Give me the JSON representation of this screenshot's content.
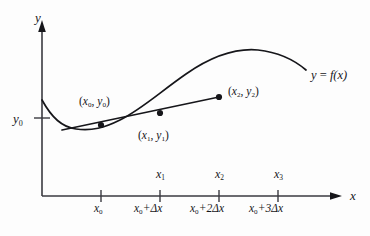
{
  "figure": {
    "type": "calculus-secant-diagram",
    "background_color": "#fdfdfd",
    "ink_color": "#16161a"
  },
  "axes": {
    "y_label": "y",
    "x_label": "x",
    "origin": {
      "x": 42,
      "y": 196
    },
    "y_axis_top": {
      "x": 42,
      "y": 22
    },
    "x_axis_right": {
      "x": 340,
      "y": 196
    }
  },
  "y_axis": {
    "tick_label": "y",
    "tick_sub": "0",
    "tick_y": 118
  },
  "curve": {
    "label_y": "y",
    "label_eq": " = ",
    "label_f": "f",
    "label_arg": "(x)",
    "path": "M 42,100 C 52,118 62,127 76,129 C 92,131 104,128 120,120 C 142,109 160,92 186,74 C 212,56 236,48 258,50 C 276,52 292,58 306,70"
  },
  "secant": {
    "path": "M 62,130 L 219,97",
    "x_start": 62,
    "y_start": 130,
    "x_end": 219,
    "y_end": 97
  },
  "points": [
    {
      "name": "point-x0",
      "cx": 101,
      "cy": 125,
      "label_open": "(",
      "label_x": "x",
      "label_xsub": "0",
      "label_comma": ", ",
      "label_y": "y",
      "label_ysub": "0",
      "label_close": ")"
    },
    {
      "name": "point-x1",
      "cx": 160,
      "cy": 113,
      "label_open": "(",
      "label_x": "x",
      "label_xsub": "1",
      "label_comma": ", ",
      "label_y": "y",
      "label_ysub": "1",
      "label_close": ")"
    },
    {
      "name": "point-x2",
      "cx": 219,
      "cy": 97,
      "label_open": "(",
      "label_x": "x",
      "label_xsub": "2",
      "label_comma": ", ",
      "label_y": "y",
      "label_ysub": "2",
      "label_close": ")"
    }
  ],
  "x_ticks": [
    {
      "position": 101,
      "name": "",
      "name_sub": "",
      "expr_x": "x",
      "expr_xsub": "0",
      "expr_rest": ""
    },
    {
      "position": 160,
      "name": "x",
      "name_sub": "1",
      "expr_x": "x",
      "expr_xsub": "0",
      "expr_rest": "+Δx"
    },
    {
      "position": 219,
      "name": "x",
      "name_sub": "2",
      "expr_x": "x",
      "expr_xsub": "0",
      "expr_rest": "+2Δx"
    },
    {
      "position": 278,
      "name": "x",
      "name_sub": "3",
      "expr_x": "x",
      "expr_xsub": "0",
      "expr_rest": "+3Δx"
    }
  ]
}
